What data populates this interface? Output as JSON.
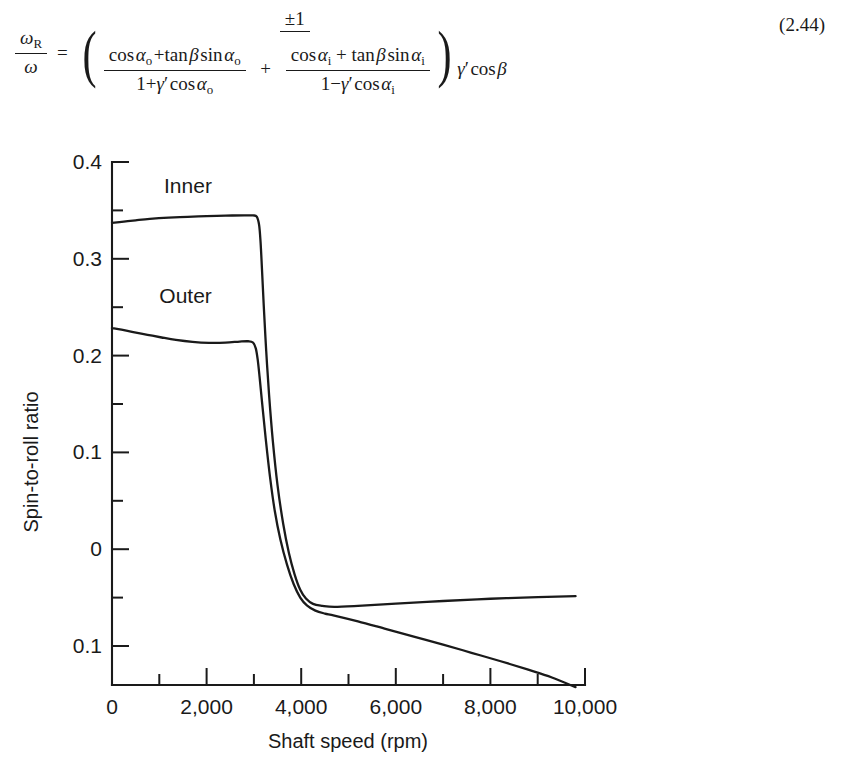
{
  "equation": {
    "id": "eq-2-44",
    "number": "(2.44)",
    "lhs_numerator": "ω",
    "lhs_numerator_sub": "R",
    "lhs_denominator": "ω",
    "relation": "=",
    "rhs_numerator": "±1",
    "term1_numerator_prefix": "cos",
    "term1_numerator": "cos α₀ + tan β sin α₀",
    "term1_denominator": "1 + γ′ cos α₀",
    "operator_between_terms": "+",
    "term2_numerator": "cos αᵢ + tan β sin αᵢ",
    "term2_denominator": "1 − γ′ cos αᵢ",
    "trailing_factor": "γ′ cos β",
    "pieces": {
      "cos": "cos",
      "tan": "tan",
      "sin": "sin",
      "alpha": "α",
      "beta": "β",
      "gamma_prime": "γ′",
      "sub_outer": "o",
      "sub_inner": "i",
      "plus": "+",
      "minus": "−",
      "one": "1",
      "plus_minus_one": "±1"
    }
  },
  "chart_data": {
    "type": "line",
    "title": "",
    "xlabel": "Shaft speed (rpm)",
    "ylabel": "Spin-to-roll ratio",
    "xlim": [
      0,
      10000
    ],
    "ylim": [
      -0.1,
      0.4
    ],
    "grid": false,
    "legend": "inline-labels",
    "x_ticks_major": [
      0,
      2000,
      4000,
      6000,
      8000,
      10000
    ],
    "x_tick_labels": [
      "0",
      "2,000",
      "4,000",
      "6,000",
      "8,000",
      "10,000"
    ],
    "x_ticks_minor": [
      1000,
      3000,
      5000,
      7000,
      9000
    ],
    "y_ticks_major": [
      0.4,
      0.3,
      0.2,
      0.1,
      0,
      -0.1
    ],
    "y_tick_labels": [
      "0.4",
      "0.3",
      "0.2",
      "0.1",
      "0",
      "0.1"
    ],
    "y_ticks_minor": [
      0.35,
      0.25,
      0.15,
      0.05,
      -0.05
    ],
    "series": [
      {
        "name": "Inner",
        "label": "Inner",
        "label_x": 1100,
        "label_y": 0.368,
        "color": "#1a1a1a",
        "points": [
          [
            0,
            0.337
          ],
          [
            250,
            0.3385
          ],
          [
            500,
            0.3398
          ],
          [
            800,
            0.3412
          ],
          [
            1200,
            0.3425
          ],
          [
            1600,
            0.3434
          ],
          [
            2000,
            0.3441
          ],
          [
            2400,
            0.3446
          ],
          [
            2800,
            0.3449
          ],
          [
            2980,
            0.3448
          ],
          [
            3060,
            0.3435
          ],
          [
            3110,
            0.335
          ],
          [
            3140,
            0.318
          ],
          [
            3170,
            0.29
          ],
          [
            3210,
            0.25
          ],
          [
            3260,
            0.205
          ],
          [
            3320,
            0.16
          ],
          [
            3400,
            0.112
          ],
          [
            3500,
            0.066
          ],
          [
            3620,
            0.026
          ],
          [
            3740,
            -0.004
          ],
          [
            3860,
            -0.026
          ],
          [
            3980,
            -0.042
          ],
          [
            4100,
            -0.051
          ],
          [
            4250,
            -0.0565
          ],
          [
            4450,
            -0.0585
          ],
          [
            4700,
            -0.0595
          ],
          [
            5200,
            -0.0585
          ],
          [
            6000,
            -0.0562
          ],
          [
            7000,
            -0.0535
          ],
          [
            8000,
            -0.0512
          ],
          [
            9000,
            -0.0495
          ],
          [
            9800,
            -0.0485
          ]
        ]
      },
      {
        "name": "Outer",
        "label": "Outer",
        "label_x": 1000,
        "label_y": 0.254,
        "color": "#1a1a1a",
        "points": [
          [
            0,
            0.2285
          ],
          [
            200,
            0.2268
          ],
          [
            450,
            0.2243
          ],
          [
            750,
            0.2215
          ],
          [
            1050,
            0.2187
          ],
          [
            1350,
            0.2162
          ],
          [
            1700,
            0.2142
          ],
          [
            2050,
            0.2132
          ],
          [
            2400,
            0.2134
          ],
          [
            2700,
            0.2145
          ],
          [
            2880,
            0.2148
          ],
          [
            2980,
            0.2135
          ],
          [
            3040,
            0.2075
          ],
          [
            3080,
            0.196
          ],
          [
            3120,
            0.178
          ],
          [
            3180,
            0.148
          ],
          [
            3250,
            0.114
          ],
          [
            3340,
            0.075
          ],
          [
            3440,
            0.04
          ],
          [
            3560,
            0.01
          ],
          [
            3700,
            -0.016
          ],
          [
            3840,
            -0.036
          ],
          [
            3980,
            -0.05
          ],
          [
            4120,
            -0.058
          ],
          [
            4300,
            -0.0635
          ],
          [
            4500,
            -0.0665
          ],
          [
            4700,
            -0.0685
          ],
          [
            5200,
            -0.0745
          ],
          [
            5800,
            -0.0825
          ],
          [
            6400,
            -0.0905
          ],
          [
            7000,
            -0.0985
          ],
          [
            7600,
            -0.107
          ],
          [
            8200,
            -0.1155
          ],
          [
            8800,
            -0.1245
          ],
          [
            9300,
            -0.1325
          ],
          [
            9800,
            -0.1425
          ]
        ]
      }
    ]
  }
}
